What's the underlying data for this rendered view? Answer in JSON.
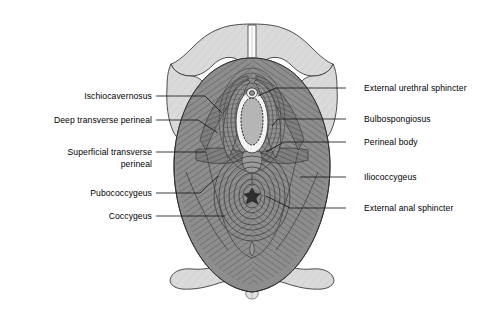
{
  "figure": {
    "background_color": "#ffffff",
    "bone_color": "#d9d9d9",
    "muscle_color": "#8a8a8a",
    "muscle_dark_color": "#6e6e6e",
    "fiber_line_color": "#4a4a4a",
    "outline_color": "#2b2b2b",
    "leader_color": "#1a1a1a",
    "opening_fill": "#b5b5b5",
    "opening_rim": "#efefef",
    "anal_center_color": "#303030"
  },
  "labels_left": [
    {
      "id": "ischiocavernosus",
      "text": "Ischiocavernosus",
      "x": 52,
      "y": 91,
      "width": 100,
      "lines": 1,
      "leader": {
        "x1": 156,
        "y1": 96,
        "x2": 222,
        "y2": 113
      }
    },
    {
      "id": "deep-transverse-perineal",
      "text": "Deep transverse perineal",
      "x": 14,
      "y": 115,
      "width": 138,
      "lines": 1,
      "leader": {
        "x1": 156,
        "y1": 120,
        "x2": 218,
        "y2": 133
      }
    },
    {
      "id": "superficial-transverse-perineal",
      "text": "Superficial transverse\nperineal",
      "x": 24,
      "y": 147,
      "width": 128,
      "lines": 2,
      "leader": {
        "x1": 156,
        "y1": 152,
        "x2": 206,
        "y2": 152
      }
    },
    {
      "id": "pubococcygeus",
      "text": "Pubococcygeus",
      "x": 62,
      "y": 188,
      "width": 90,
      "lines": 1,
      "leader": {
        "x1": 156,
        "y1": 193,
        "x2": 218,
        "y2": 176
      }
    },
    {
      "id": "coccygeus",
      "text": "Coccygeus",
      "x": 80,
      "y": 211,
      "width": 72,
      "lines": 1,
      "leader": {
        "x1": 156,
        "y1": 216,
        "x2": 225,
        "y2": 216
      }
    }
  ],
  "labels_right": [
    {
      "id": "external-urethral-sphincter",
      "text": "External urethral sphincter",
      "x": 364,
      "y": 83,
      "lines": 1,
      "leader": {
        "x1": 346,
        "y1": 88,
        "x2": 258,
        "y2": 96
      }
    },
    {
      "id": "bulbospongiosus",
      "text": "Bulbospongiosus",
      "x": 364,
      "y": 114,
      "lines": 1,
      "leader": {
        "x1": 346,
        "y1": 119,
        "x2": 278,
        "y2": 126
      }
    },
    {
      "id": "perineal-body",
      "text": "Perineal body",
      "x": 364,
      "y": 137,
      "lines": 1,
      "leader": {
        "x1": 346,
        "y1": 142,
        "x2": 268,
        "y2": 152
      }
    },
    {
      "id": "iliococcygeus",
      "text": "Iliococcygeus",
      "x": 364,
      "y": 172,
      "lines": 1,
      "leader": {
        "x1": 346,
        "y1": 177,
        "x2": 300,
        "y2": 184
      }
    },
    {
      "id": "external-anal-sphincter",
      "text": "External anal sphincter",
      "x": 364,
      "y": 203,
      "lines": 1,
      "leader": {
        "x1": 346,
        "y1": 208,
        "x2": 266,
        "y2": 196
      }
    }
  ],
  "structures": [
    {
      "id": "pubic-arch",
      "name": "pubic symphysis and inferior pubic rami",
      "type": "bone"
    },
    {
      "id": "ischial-tuberosity-left",
      "name": "left ischial tuberosity",
      "type": "bone"
    },
    {
      "id": "ischial-tuberosity-right",
      "name": "right ischial tuberosity",
      "type": "bone"
    },
    {
      "id": "sacrum-coccyx",
      "name": "sacrum and coccyx",
      "type": "bone"
    },
    {
      "id": "urethral-opening",
      "name": "external urethral orifice",
      "type": "opening"
    },
    {
      "id": "vaginal-opening",
      "name": "vaginal orifice",
      "type": "opening"
    },
    {
      "id": "anal-opening",
      "name": "anal orifice",
      "type": "opening"
    },
    {
      "id": "levator-ani",
      "name": "levator ani muscle sheet",
      "type": "muscle"
    }
  ]
}
